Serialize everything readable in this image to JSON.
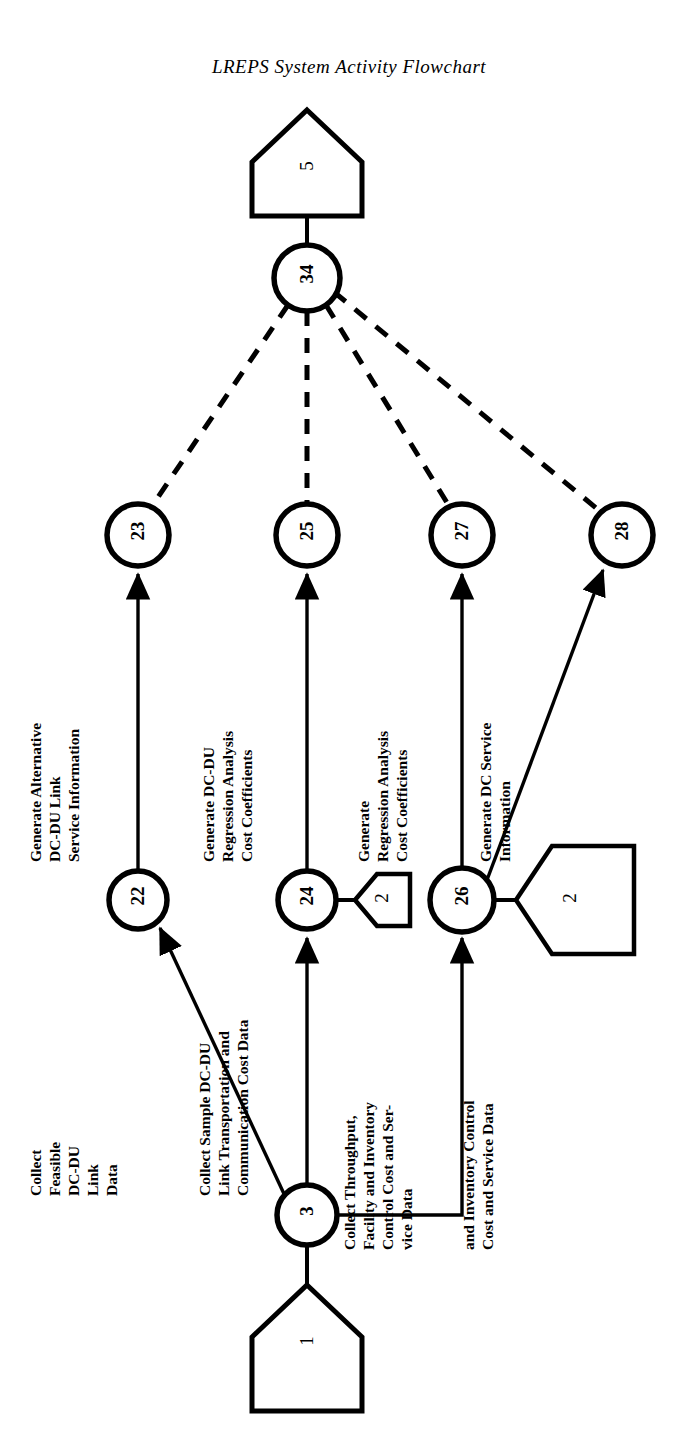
{
  "title": "LREPS System Activity Flowchart",
  "diagram": {
    "type": "activity-flowchart",
    "orientation": "bottom-to-top",
    "stroke_color": "#000000",
    "background_color": "#ffffff",
    "nodes": [
      {
        "id": "n5",
        "label": "5",
        "shape": "pentagon",
        "cx": 307,
        "cy": 170
      },
      {
        "id": "n34",
        "label": "34",
        "shape": "circle",
        "cx": 307,
        "cy": 278,
        "r": 33
      },
      {
        "id": "n23",
        "label": "23",
        "shape": "circle",
        "cx": 138,
        "cy": 535,
        "r": 31
      },
      {
        "id": "n25",
        "label": "25",
        "shape": "circle",
        "cx": 307,
        "cy": 535,
        "r": 31
      },
      {
        "id": "n27",
        "label": "27",
        "shape": "circle",
        "cx": 462,
        "cy": 535,
        "r": 31
      },
      {
        "id": "n28",
        "label": "28",
        "shape": "circle",
        "cx": 622,
        "cy": 535,
        "r": 31
      },
      {
        "id": "n22",
        "label": "22",
        "shape": "circle",
        "cx": 138,
        "cy": 900,
        "r": 29
      },
      {
        "id": "n24",
        "label": "24",
        "shape": "circle",
        "cx": 307,
        "cy": 900,
        "r": 29
      },
      {
        "id": "n26",
        "label": "26",
        "shape": "circle",
        "cx": 462,
        "cy": 900,
        "r": 32
      },
      {
        "id": "p2a",
        "label": "2",
        "shape": "pentagon-small",
        "cx": 380,
        "cy": 900
      },
      {
        "id": "p2b",
        "label": "2",
        "shape": "pentagon-large",
        "cx": 570,
        "cy": 900
      },
      {
        "id": "n3",
        "label": "3",
        "shape": "circle",
        "cx": 307,
        "cy": 1215,
        "r": 30
      },
      {
        "id": "p1",
        "label": "1",
        "shape": "pentagon",
        "cx": 307,
        "cy": 1345
      }
    ],
    "edges": [
      {
        "from": "n34",
        "to": "n5",
        "style": "solid"
      },
      {
        "from": "n34",
        "to": "n23",
        "style": "dashed"
      },
      {
        "from": "n34",
        "to": "n25",
        "style": "dashed"
      },
      {
        "from": "n34",
        "to": "n27",
        "style": "dashed"
      },
      {
        "from": "n34",
        "to": "n28",
        "style": "dashed"
      },
      {
        "from": "n22",
        "to": "n23",
        "style": "solid",
        "arrow": true
      },
      {
        "from": "n24",
        "to": "n25",
        "style": "solid",
        "arrow": true
      },
      {
        "from": "n26",
        "to": "n27",
        "style": "solid",
        "arrow": true
      },
      {
        "from": "n26",
        "to": "n28",
        "style": "solid",
        "arrow": true
      },
      {
        "from": "n24",
        "to": "p2a",
        "style": "solid"
      },
      {
        "from": "n26",
        "to": "p2b",
        "style": "solid"
      },
      {
        "from": "n3",
        "to": "n22",
        "style": "solid",
        "arrow": true
      },
      {
        "from": "n3",
        "to": "n24",
        "style": "solid",
        "arrow": true
      },
      {
        "from": "n3",
        "to": "n26",
        "style": "solid",
        "arrow": true
      },
      {
        "from": "n3",
        "to": "p1",
        "style": "solid"
      }
    ],
    "edge_labels": [
      {
        "id": "lbl_22_23",
        "lines": [
          "Generate Alternative",
          "DC-DU Link",
          "Service Information"
        ]
      },
      {
        "id": "lbl_24_25",
        "lines": [
          "Generate DC-DU",
          "Regression Analysis",
          "Cost Coefficients"
        ]
      },
      {
        "id": "lbl_26_27",
        "lines": [
          "Generate",
          "Regression Analysis",
          "Cost Coefficients"
        ]
      },
      {
        "id": "lbl_26_28",
        "lines": [
          "Generate DC Service",
          "Information"
        ]
      },
      {
        "id": "lbl_3_22",
        "lines": [
          "Collect",
          "Feasible",
          "DC-DU",
          "Link",
          "Data"
        ]
      },
      {
        "id": "lbl_3_24",
        "lines": [
          "Collect Sample DC-DU",
          "Link Transportation and",
          "Communication Cost Data"
        ]
      },
      {
        "id": "lbl_3_26a",
        "lines": [
          "Collect Throughput,",
          "Facility and Inventory",
          "Control Cost and Ser-",
          "vice Data"
        ]
      },
      {
        "id": "lbl_3_26b",
        "lines": [
          "and Inventory Control",
          "Cost and Service Data"
        ]
      }
    ]
  }
}
